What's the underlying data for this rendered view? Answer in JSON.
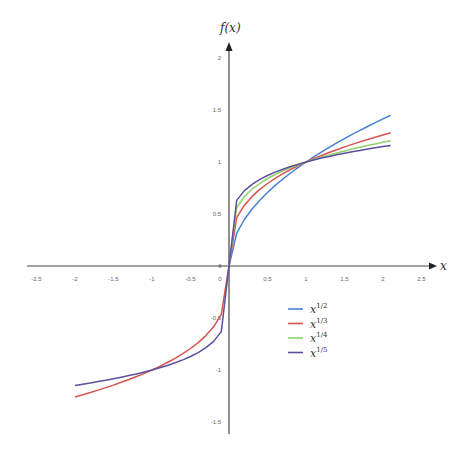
{
  "chart_data": {
    "type": "line",
    "title": "",
    "xlabel": "x",
    "ylabel": "f(x)",
    "xlim": [
      -2.5,
      2.5
    ],
    "ylim": [
      -1.5,
      2
    ],
    "x_ticks": [
      "-2.5",
      "-2",
      "-1.5",
      "-1",
      "-0.5",
      "0",
      "0.5",
      "1",
      "1.5",
      "2",
      "2.5"
    ],
    "x_tick_values": [
      -2.5,
      -2,
      -1.5,
      -1,
      -0.5,
      0,
      0.5,
      1,
      1.5,
      2,
      2.5
    ],
    "y_ticks": [
      "2",
      "1.5",
      "1",
      "0.5",
      "-0.5",
      "-1",
      "-1.5"
    ],
    "y_tick_values": [
      2,
      1.5,
      1,
      0.5,
      -0.5,
      -1,
      -1.5
    ],
    "grid": false,
    "legend_position": "lower-right-of-origin",
    "sample_step": 0.1,
    "series": [
      {
        "name": "x^{1/2}",
        "base": "x",
        "exponent": "1/2",
        "root": 2,
        "domain": [
          0,
          2.1
        ],
        "color": "#4a7fd4"
      },
      {
        "name": "x^{1/3}",
        "base": "x",
        "exponent": "1/3",
        "root": 3,
        "domain": [
          -2,
          2.1
        ],
        "color": "#d9534f"
      },
      {
        "name": "x^{1/4}",
        "base": "x",
        "exponent": "1/4",
        "root": 4,
        "domain": [
          0,
          2.1
        ],
        "color": "#8fd16a"
      },
      {
        "name": "x^{1/5}",
        "base": "x",
        "exponent": "1/5",
        "root": 5,
        "domain": [
          -2,
          2.1
        ],
        "color": "#5b4fa0"
      }
    ]
  },
  "legend": {
    "items": [
      {
        "base": "x",
        "exp": "1/2",
        "color": "#4a7fd4"
      },
      {
        "base": "x",
        "exp": "1/3",
        "color": "#d9534f"
      },
      {
        "base": "x",
        "exp": "1/4",
        "color": "#8fd16a"
      },
      {
        "base": "x",
        "exp": "1/5",
        "color": "#5b4fa0"
      }
    ]
  },
  "axes": {
    "x_label": "x",
    "y_label": "f(x)",
    "axis_color": "#444444"
  }
}
